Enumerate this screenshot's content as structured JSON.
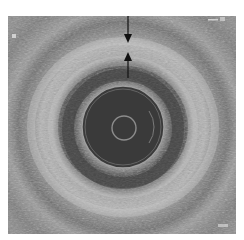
{
  "image": {
    "type": "intravascular ultrasound cross-section",
    "description": "Grayscale IVUS image showing concentric vessel wall layers around a central catheter; two black arrows indicate the thickness of a layer at the 12 o'clock position",
    "colors": {
      "background": "#ffffff",
      "tissue_mid": "#7a7a7a",
      "tissue_bright": "#c8c8c8",
      "lumen": "#3c3c3c",
      "catheter_ring": "#9a9a9a",
      "arrow": "#111111"
    }
  },
  "annotations": {
    "arrows": [
      {
        "id": "arrow-down",
        "direction": "down"
      },
      {
        "id": "arrow-up",
        "direction": "up"
      }
    ],
    "scale_label_top": "",
    "scale_label_bottom": ""
  }
}
